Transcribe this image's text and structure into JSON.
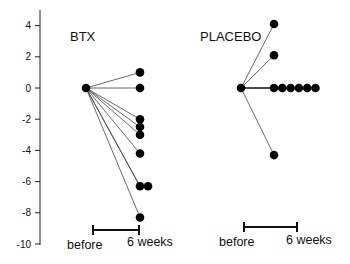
{
  "chart_data": {
    "type": "scatter",
    "title": "",
    "xlabel": "",
    "ylabel": "",
    "ylim": [
      -10,
      4.5
    ],
    "yticks": [
      4,
      2,
      0,
      -2,
      -4,
      -6,
      -8,
      -10
    ],
    "grid": false,
    "panels": [
      {
        "name": "BTX",
        "x_labels": [
          "before",
          "6 weeks"
        ],
        "before": 0,
        "after": [
          1.0,
          0.0,
          -2.0,
          -2.5,
          -3.0,
          -4.2,
          -6.3,
          -6.3,
          -8.3
        ]
      },
      {
        "name": "PLACEBO",
        "x_labels": [
          "before",
          "6 weeks"
        ],
        "before": 0,
        "after": [
          4.1,
          2.1,
          0.0,
          0.0,
          0.0,
          0.0,
          0.0,
          0.0,
          -4.3
        ]
      }
    ]
  },
  "yaxis": {
    "ticks": [
      "4",
      "2",
      "0",
      "-2",
      "-4",
      "-6",
      "-8",
      "-10"
    ]
  },
  "panels": {
    "btx": {
      "label": "BTX",
      "before": "before",
      "after": "6 weeks"
    },
    "placebo": {
      "label": "PLACEBO",
      "before": "before",
      "after": "6 weeks"
    }
  }
}
